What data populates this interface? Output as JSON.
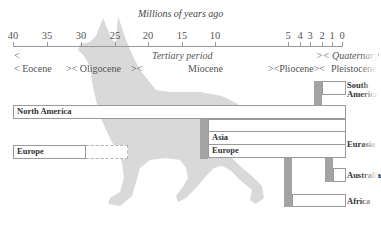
{
  "figure": {
    "axis_title": "Millions of years ago",
    "ticks": [
      {
        "label": "40",
        "x": 13
      },
      {
        "label": "35",
        "x": 47
      },
      {
        "label": "30",
        "x": 81
      },
      {
        "label": "25",
        "x": 115
      },
      {
        "label": "20",
        "x": 148
      },
      {
        "label": "15",
        "x": 182
      },
      {
        "label": "10",
        "x": 215
      },
      {
        "label": "5",
        "x": 288
      },
      {
        "label": "4",
        "x": 300
      },
      {
        "label": "3",
        "x": 310
      },
      {
        "label": "2",
        "x": 322
      },
      {
        "label": "1",
        "x": 332
      },
      {
        "label": "0",
        "x": 342
      }
    ],
    "periods": {
      "tertiary_open": "<",
      "tertiary": "Tertiary period",
      "quaternary": ">< Quaternary"
    },
    "epochs": {
      "eocene": "< Eocene",
      "oligocene": ">< Oligocene",
      "miocene_open": "><",
      "miocene": "Miocene",
      "pliocene": "><Pliocene><",
      "pleistocene": "Pleistocene"
    },
    "regions": {
      "north_america": "North America",
      "europe_early": "Europe",
      "asia": "Asia",
      "europe": "Europe",
      "south_america": "South America",
      "eurasia": "Eurasia",
      "australia": "Australia",
      "africa": "Africa"
    },
    "colors": {
      "connector": "#a3a3a3",
      "silhouette": "#d9d9d9",
      "border": "#9a9a9a"
    }
  }
}
